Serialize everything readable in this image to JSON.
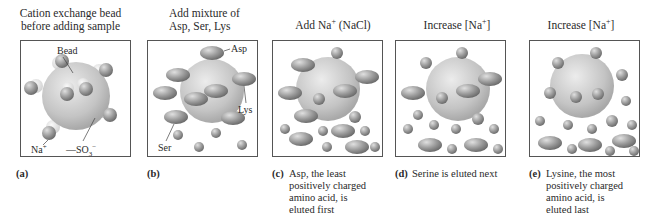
{
  "panels": [
    {
      "id": "a",
      "title": [
        "Cation exchange bead",
        "before adding sample"
      ],
      "letter": "(a)",
      "caption": "",
      "labels": {
        "bead": "Bead",
        "na": "Na",
        "na_sup": "+",
        "so3": "—SO",
        "so3_sub": "3",
        "so3_sup": "−"
      }
    },
    {
      "id": "b",
      "title": [
        "Add mixture of",
        "Asp, Ser, Lys"
      ],
      "letter": "(b)",
      "caption": "",
      "labels": {
        "asp": "Asp",
        "lys": "Lys",
        "ser": "Ser"
      }
    },
    {
      "id": "c",
      "title": [
        "Add Na",
        "+",
        " (NaCl)"
      ],
      "letter": "(c)",
      "caption": [
        "Asp, the least",
        "positively charged",
        "amino acid, is",
        "eluted first"
      ]
    },
    {
      "id": "d",
      "title": [
        "Increase [Na",
        "+",
        "]"
      ],
      "letter": "(d)",
      "caption": [
        "Serine is eluted next"
      ]
    },
    {
      "id": "e",
      "title": [
        "Increase [Na",
        "+",
        "]"
      ],
      "letter": "(e)",
      "caption": [
        "Lysine, the most",
        "positively charged",
        "amino acid, is",
        "eluted last"
      ]
    }
  ],
  "colors": {
    "bead": "#c8c8c8",
    "sphere": "#8e8e8e",
    "ellipse": "#8a8a8a",
    "border": "#555555"
  }
}
